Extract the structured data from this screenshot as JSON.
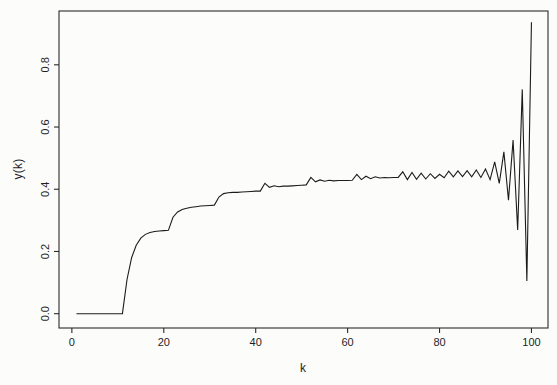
{
  "figure": {
    "background": "#fcfcfb",
    "line_color": "#1c1c1c",
    "axis_color": "#2b2b2b",
    "text_color": "#1f1f1f"
  },
  "chart_data": {
    "type": "line",
    "title": "",
    "xlabel": "k",
    "ylabel": "y(k)",
    "grid": false,
    "legend": null,
    "xlim": [
      -2.8,
      103.6
    ],
    "ylim": [
      -0.046,
      0.973
    ],
    "x_ticks": [
      0,
      20,
      40,
      60,
      80,
      100
    ],
    "y_ticks": [
      "0.0",
      "0.2",
      "0.4",
      "0.6",
      "0.8"
    ],
    "y_tick_values": [
      0,
      0.2,
      0.4,
      0.6,
      0.8
    ],
    "x": [
      1,
      2,
      3,
      4,
      5,
      6,
      7,
      8,
      9,
      10,
      11,
      12,
      13,
      14,
      15,
      16,
      17,
      18,
      19,
      20,
      21,
      22,
      23,
      24,
      25,
      26,
      27,
      28,
      29,
      30,
      31,
      32,
      33,
      34,
      35,
      36,
      37,
      38,
      39,
      40,
      41,
      42,
      43,
      44,
      45,
      46,
      47,
      48,
      49,
      50,
      51,
      52,
      53,
      54,
      55,
      56,
      57,
      58,
      59,
      60,
      61,
      62,
      63,
      64,
      65,
      66,
      67,
      68,
      69,
      70,
      71,
      72,
      73,
      74,
      75,
      76,
      77,
      78,
      79,
      80,
      81,
      82,
      83,
      84,
      85,
      86,
      87,
      88,
      89,
      90,
      91,
      92,
      93,
      94,
      95,
      96,
      97,
      98,
      99,
      100
    ],
    "y": [
      0,
      0,
      0,
      0,
      0,
      0,
      0,
      0,
      0,
      0,
      0,
      0.11,
      0.18,
      0.22,
      0.243,
      0.255,
      0.261,
      0.264,
      0.266,
      0.267,
      0.268,
      0.31,
      0.327,
      0.335,
      0.339,
      0.342,
      0.344,
      0.346,
      0.347,
      0.348,
      0.349,
      0.375,
      0.386,
      0.389,
      0.39,
      0.39,
      0.391,
      0.392,
      0.393,
      0.394,
      0.394,
      0.419,
      0.406,
      0.411,
      0.408,
      0.41,
      0.41,
      0.411,
      0.412,
      0.413,
      0.414,
      0.438,
      0.424,
      0.43,
      0.426,
      0.429,
      0.427,
      0.428,
      0.428,
      0.428,
      0.429,
      0.448,
      0.431,
      0.442,
      0.434,
      0.44,
      0.436,
      0.438,
      0.437,
      0.438,
      0.438,
      0.456,
      0.431,
      0.454,
      0.432,
      0.452,
      0.433,
      0.45,
      0.435,
      0.448,
      0.437,
      0.458,
      0.44,
      0.459,
      0.441,
      0.46,
      0.44,
      0.462,
      0.438,
      0.465,
      0.431,
      0.488,
      0.419,
      0.52,
      0.365,
      0.558,
      0.269,
      0.721,
      0.105,
      0.937
    ]
  }
}
